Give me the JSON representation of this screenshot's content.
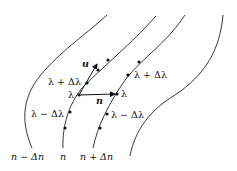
{
  "diagram": {
    "curve_labels": [
      "n − Δn",
      "n",
      "n + Δn"
    ],
    "point_labels": {
      "left_plus": "λ + Δλ",
      "left_center": "λ",
      "left_minus": "λ − Δλ",
      "right_plus": "λ + Δλ",
      "right_center": "λ",
      "right_minus": "λ − Δλ"
    },
    "vector_labels": {
      "tangent": "u",
      "normal": "n"
    }
  }
}
